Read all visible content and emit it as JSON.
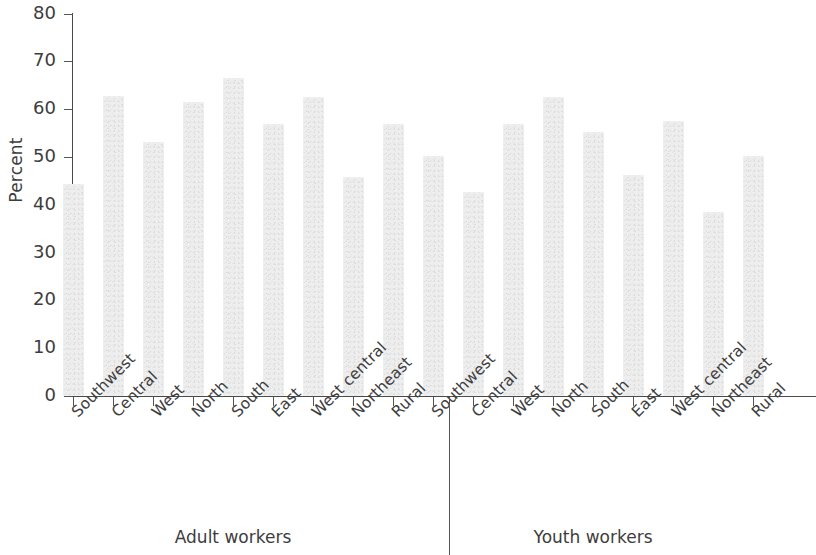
{
  "chart_data": {
    "type": "bar",
    "title": "",
    "xlabel": "",
    "ylabel": "Percent",
    "ylim": [
      0,
      80
    ],
    "yticks": [
      0,
      10,
      20,
      30,
      40,
      50,
      60,
      70,
      80
    ],
    "grid": false,
    "legend": null,
    "groups": [
      {
        "name": "Adult workers",
        "categories": [
          "Southwest",
          "Central",
          "West",
          "North",
          "South",
          "East",
          "West central",
          "Northeast",
          "Rural"
        ],
        "values": [
          44.4,
          62.8,
          53.2,
          61.4,
          66.6,
          56.8,
          62.6,
          45.9,
          56.8
        ]
      },
      {
        "name": "Youth workers",
        "categories": [
          "Southwest",
          "Central",
          "West",
          "North",
          "South",
          "East",
          "West central",
          "Northeast",
          "Rural"
        ],
        "values": [
          50.1,
          42.6,
          56.8,
          62.6,
          55.2,
          46.3,
          57.5,
          38.5,
          50.3
        ]
      }
    ],
    "bar_color": "#ececec",
    "axis_color": "#4a4a4a",
    "text_color": "#3d3d3d"
  },
  "axis": {
    "ylabel": "Percent",
    "ytick_labels": [
      "0",
      "10",
      "20",
      "30",
      "40",
      "50",
      "60",
      "70",
      "80"
    ]
  },
  "groups": {
    "adult_label": "Adult workers",
    "youth_label": "Youth workers"
  }
}
